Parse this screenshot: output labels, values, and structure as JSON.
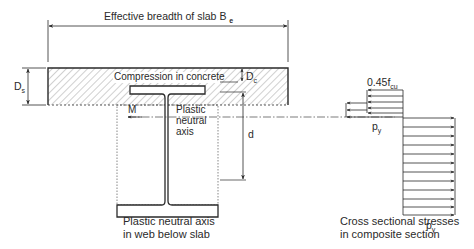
{
  "title_dimension": {
    "label": "Effective breadth of slab B",
    "subscript": "e"
  },
  "slab": {
    "depth_label": "D",
    "depth_subscript": "s",
    "compression_label": "Compression in concrete"
  },
  "neutral_axis": {
    "depth_label": "D",
    "depth_subscript": "c",
    "moment_label": "M",
    "label_line1": "Plastic",
    "label_line2": "neutral",
    "label_line3": "axis"
  },
  "beam": {
    "depth_label": "d"
  },
  "stress_diagram": {
    "concrete_stress": "0.45f",
    "concrete_stress_subscript": "cu",
    "steel_compression_label": "p",
    "steel_compression_subscript": "y",
    "steel_tension_label": "p",
    "steel_tension_subscript": "y"
  },
  "captions": {
    "left_line1": "Plastic neutral axis",
    "left_line2": "in web below slab",
    "right_line1": "Cross sectional stresses",
    "right_line2": "in composite section"
  },
  "colors": {
    "line": "#2a2a2a",
    "hatch": "#8a8a8a",
    "background": "#ffffff"
  }
}
